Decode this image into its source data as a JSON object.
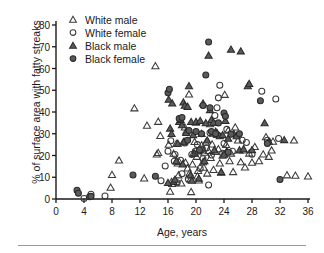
{
  "chart_data": {
    "type": "scatter",
    "title": "",
    "xlabel": "Age, years",
    "ylabel": "% of surface area with fatty streaks",
    "xlim": [
      0,
      36
    ],
    "ylim": [
      0,
      80
    ],
    "xticks": [
      0,
      4,
      8,
      12,
      16,
      20,
      24,
      28,
      32,
      36
    ],
    "yticks": [
      0,
      10,
      20,
      30,
      40,
      50,
      60,
      70,
      80
    ],
    "grid": false,
    "legend_position": "top-left-inside",
    "series": [
      {
        "name": "White male",
        "marker": "open-triangle",
        "color": "#3a3a3a",
        "points": [
          [
            7.8,
            5.3
          ],
          [
            8.0,
            11.2
          ],
          [
            12.6,
            9.6
          ],
          [
            14.4,
            20.6
          ],
          [
            14.6,
            21.3
          ],
          [
            14.9,
            29.1
          ],
          [
            16.1,
            25.1
          ],
          [
            16.3,
            3.5
          ],
          [
            16.5,
            8.0
          ],
          [
            16.6,
            7.0
          ],
          [
            16.8,
            20.9
          ],
          [
            17.2,
            25.4
          ],
          [
            17.4,
            16.5
          ],
          [
            17.6,
            17.2
          ],
          [
            17.5,
            11.0
          ],
          [
            17.9,
            7.3
          ],
          [
            18.2,
            26.2
          ],
          [
            18.4,
            33.0
          ],
          [
            18.6,
            31.2
          ],
          [
            18.5,
            16.8
          ],
          [
            18.8,
            14.2
          ],
          [
            19.0,
            48.2
          ],
          [
            19.1,
            12.0
          ],
          [
            19.2,
            9.0
          ],
          [
            19.3,
            3.3
          ],
          [
            19.6,
            21.0
          ],
          [
            19.8,
            26.3
          ],
          [
            20.0,
            35.2
          ],
          [
            20.1,
            19.5
          ],
          [
            20.3,
            13.0
          ],
          [
            20.4,
            8.6
          ],
          [
            20.6,
            22.5
          ],
          [
            20.8,
            24.8
          ],
          [
            21.0,
            17.0
          ],
          [
            21.2,
            21.4
          ],
          [
            21.4,
            26.0
          ],
          [
            21.6,
            11.8
          ],
          [
            21.8,
            22.2
          ],
          [
            22.0,
            34.5
          ],
          [
            22.1,
            19.0
          ],
          [
            22.3,
            25.2
          ],
          [
            22.5,
            13.5
          ],
          [
            22.8,
            21.8
          ],
          [
            23.0,
            29.6
          ],
          [
            23.2,
            23.0
          ],
          [
            23.4,
            16.5
          ],
          [
            23.6,
            12.2
          ],
          [
            23.8,
            20.0
          ],
          [
            24.1,
            48.0
          ],
          [
            24.3,
            25.0
          ],
          [
            24.6,
            31.5
          ],
          [
            24.8,
            17.5
          ],
          [
            25.0,
            21.0
          ],
          [
            25.3,
            12.5
          ],
          [
            25.6,
            33.0
          ],
          [
            26.0,
            27.0
          ],
          [
            26.4,
            17.0
          ],
          [
            26.8,
            22.4
          ],
          [
            27.0,
            14.6
          ],
          [
            27.6,
            21.0
          ],
          [
            28.0,
            16.8
          ],
          [
            28.4,
            24.0
          ],
          [
            29.0,
            17.5
          ],
          [
            29.6,
            20.6
          ],
          [
            30.0,
            28.5
          ],
          [
            30.4,
            19.5
          ],
          [
            30.8,
            22.4
          ],
          [
            31.0,
            26.5
          ],
          [
            33.0,
            11.0
          ],
          [
            34.0,
            27.0
          ],
          [
            36.0,
            10.5
          ],
          [
            34.2,
            10.8
          ],
          [
            11.2,
            41.8
          ],
          [
            14.2,
            61.2
          ],
          [
            13.0,
            33.8
          ],
          [
            14.6,
            35.6
          ],
          [
            9.0,
            17.8
          ],
          [
            19.5,
            16.0
          ],
          [
            21.1,
            14.5
          ],
          [
            20.2,
            10.5
          ]
        ]
      },
      {
        "name": "White female",
        "marker": "open-circle",
        "color": "#3a3a3a",
        "points": [
          [
            4.0,
            0.2
          ],
          [
            5.0,
            2.2
          ],
          [
            7.0,
            1.4
          ],
          [
            15.0,
            8.4
          ],
          [
            15.6,
            15.2
          ],
          [
            16.0,
            22.0
          ],
          [
            16.4,
            26.8
          ],
          [
            16.9,
            17.4
          ],
          [
            17.3,
            7.5
          ],
          [
            17.8,
            17.8
          ],
          [
            18.0,
            11.6
          ],
          [
            18.4,
            25.8
          ],
          [
            18.9,
            9.2
          ],
          [
            19.4,
            20.5
          ],
          [
            19.9,
            22.0
          ],
          [
            20.2,
            25.0
          ],
          [
            20.6,
            14.0
          ],
          [
            21.0,
            18.5
          ],
          [
            21.5,
            23.5
          ],
          [
            21.8,
            6.4
          ],
          [
            22.0,
            30.5
          ],
          [
            22.4,
            35.0
          ],
          [
            22.7,
            38.4
          ],
          [
            23.0,
            42.0
          ],
          [
            23.2,
            46.5
          ],
          [
            23.4,
            52.3
          ],
          [
            23.8,
            21.0
          ],
          [
            24.0,
            25.5
          ],
          [
            24.4,
            32.0
          ],
          [
            25.2,
            22.0
          ],
          [
            26.6,
            27.0
          ],
          [
            27.2,
            26.0
          ],
          [
            28.0,
            20.6
          ],
          [
            29.4,
            49.5
          ],
          [
            30.2,
            27.0
          ],
          [
            31.4,
            46.0
          ],
          [
            31.8,
            27.8
          ],
          [
            20.9,
            22.8
          ],
          [
            22.2,
            20.2
          ],
          [
            17.0,
            20.5
          ]
        ]
      },
      {
        "name": "Black male",
        "marker": "filled-triangle",
        "color": "#5a5a5a",
        "points": [
          [
            16.1,
            45.8
          ],
          [
            16.3,
            32.5
          ],
          [
            16.5,
            30.0
          ],
          [
            16.8,
            8.0
          ],
          [
            17.0,
            9.0
          ],
          [
            17.4,
            25.5
          ],
          [
            17.6,
            35.5
          ],
          [
            17.8,
            36.5
          ],
          [
            18.0,
            34.0
          ],
          [
            18.2,
            44.5
          ],
          [
            18.4,
            43.0
          ],
          [
            18.6,
            30.5
          ],
          [
            18.8,
            42.5
          ],
          [
            19.0,
            52.0
          ],
          [
            19.3,
            35.5
          ],
          [
            19.6,
            29.5
          ],
          [
            19.8,
            21.0
          ],
          [
            20.0,
            35.5
          ],
          [
            20.3,
            22.0
          ],
          [
            20.6,
            36.0
          ],
          [
            21.0,
            44.0
          ],
          [
            21.4,
            35.0
          ],
          [
            21.6,
            27.0
          ],
          [
            21.8,
            66.0
          ],
          [
            22.0,
            41.0
          ],
          [
            22.2,
            36.5
          ],
          [
            22.5,
            35.2
          ],
          [
            22.8,
            31.0
          ],
          [
            23.0,
            30.5
          ],
          [
            23.4,
            29.0
          ],
          [
            23.8,
            29.5
          ],
          [
            24.2,
            36.0
          ],
          [
            24.6,
            27.8
          ],
          [
            25.0,
            68.8
          ],
          [
            25.4,
            30.0
          ],
          [
            25.8,
            29.0
          ],
          [
            26.2,
            22.5
          ],
          [
            26.4,
            68.0
          ],
          [
            26.8,
            23.0
          ],
          [
            27.4,
            52.0
          ],
          [
            27.6,
            53.0
          ],
          [
            28.0,
            22.6
          ],
          [
            29.8,
            35.0
          ],
          [
            30.4,
            26.5
          ],
          [
            32.6,
            27.2
          ],
          [
            16.0,
            7.5
          ],
          [
            17.2,
            17.5
          ],
          [
            18.1,
            16.0
          ],
          [
            19.2,
            11.0
          ],
          [
            19.4,
            8.5
          ],
          [
            20.4,
            9.5
          ],
          [
            21.2,
            17.5
          ],
          [
            22.6,
            22.5
          ],
          [
            23.6,
            12.5
          ],
          [
            24.4,
            22.0
          ],
          [
            16.6,
            44.0
          ],
          [
            18.3,
            26.5
          ],
          [
            20.8,
            30.0
          ],
          [
            22.4,
            30.2
          ],
          [
            24.0,
            20.5
          ]
        ]
      },
      {
        "name": "Black female",
        "marker": "filled-circle",
        "color": "#5a5a5a",
        "points": [
          [
            3.0,
            4.0
          ],
          [
            3.2,
            2.6
          ],
          [
            4.8,
            1.0
          ],
          [
            5.0,
            1.2
          ],
          [
            11.0,
            11.0
          ],
          [
            14.2,
            10.5
          ],
          [
            16.0,
            48.8
          ],
          [
            16.2,
            50.5
          ],
          [
            17.6,
            37.0
          ],
          [
            18.0,
            37.5
          ],
          [
            19.0,
            31.5
          ],
          [
            20.0,
            31.0
          ],
          [
            20.8,
            30.0
          ],
          [
            21.0,
            43.0
          ],
          [
            21.4,
            57.0
          ],
          [
            21.8,
            72.2
          ],
          [
            22.0,
            42.0
          ],
          [
            22.2,
            31.0
          ],
          [
            22.8,
            30.0
          ],
          [
            23.2,
            35.0
          ],
          [
            24.0,
            39.5
          ],
          [
            24.2,
            38.0
          ],
          [
            24.6,
            21.5
          ],
          [
            25.0,
            29.8
          ],
          [
            26.2,
            30.0
          ],
          [
            29.2,
            45.2
          ],
          [
            30.2,
            25.5
          ],
          [
            32.0,
            9.0
          ],
          [
            18.8,
            27.0
          ],
          [
            20.5,
            22.5
          ]
        ]
      }
    ]
  },
  "legend": {
    "entries": [
      {
        "label": "White male",
        "marker": "open-triangle"
      },
      {
        "label": "White female",
        "marker": "open-circle"
      },
      {
        "label": "Black male",
        "marker": "filled-triangle"
      },
      {
        "label": "Black female",
        "marker": "filled-circle"
      }
    ]
  },
  "axes": {
    "x_tick_labels": [
      "0",
      "4",
      "8",
      "12",
      "16",
      "20",
      "24",
      "28",
      "32",
      "36"
    ],
    "y_tick_labels": [
      "0",
      "10",
      "20",
      "30",
      "40",
      "50",
      "60",
      "70",
      "80"
    ]
  },
  "colors": {
    "axis": "#1a1a1a",
    "open_marker": "#3a3a3a",
    "filled_marker": "#5a5a5a",
    "rule": "#9a9a9a"
  }
}
